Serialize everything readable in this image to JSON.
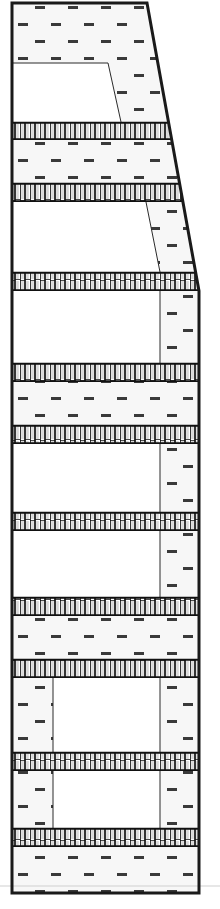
{
  "figure": {
    "kind": "engineering-cross-section",
    "canvas": {
      "width": 220,
      "height": 909,
      "background": "#ffffff"
    },
    "colors": {
      "outline": "#1a1a1a",
      "inner_line": "#2b2b2b",
      "hatch_dash": "#3a3a3a",
      "hatch_background": "#f7f7f7",
      "corrugation_stroke": "#111111",
      "corrugation_fill": "#d9d9d9",
      "plain_fill": "#ffffff",
      "faint_baseline": "#cfcfcf"
    },
    "geometry": {
      "left_edge_x": 12,
      "right_edge_bottom_x": 199,
      "right_edge_top_x": 147,
      "taper_top_y": 0,
      "taper_end_y": 291,
      "top_y": 3,
      "bottom_y": 893,
      "outline_stroke_width": 3,
      "faint_baseline_y": 886
    },
    "hatch_pattern": {
      "name": "dashed-stipple",
      "dash_width": 10,
      "dash_height": 3,
      "dash_spacing_x": 33,
      "dash_spacing_y": 17,
      "stagger": "brick-offset-half"
    },
    "corrugation_pattern": {
      "name": "square-wave-crenellation",
      "period": 10,
      "stroke_width": 1.6,
      "description": "vertical square-wave / crenellated core band"
    }
  },
  "layers": [
    {
      "id": "L01",
      "name": "hatched-band-top",
      "type": "hatched",
      "y_top": 3,
      "y_bottom": 63,
      "label": "Hatched band"
    },
    {
      "id": "L02",
      "name": "plain-band-tapered-upper",
      "type": "plain-tapered",
      "y_top": 63,
      "y_bottom": 122,
      "label": "Plain band (tapered)",
      "inner_line_top_x": 108,
      "inner_line_bottom_x": 121
    },
    {
      "id": "L03",
      "name": "corrugated-core-1",
      "type": "corrugated",
      "y_top": 122,
      "y_bottom": 140,
      "label": "Corrugated core"
    },
    {
      "id": "L04",
      "name": "hatched-band-2",
      "type": "hatched",
      "y_top": 140,
      "y_bottom": 183,
      "label": "Hatched band"
    },
    {
      "id": "L05",
      "name": "corrugated-core-2",
      "type": "corrugated",
      "y_top": 183,
      "y_bottom": 202,
      "label": "Corrugated core"
    },
    {
      "id": "L06",
      "name": "plain-band-tapered-lower",
      "type": "plain-tapered",
      "y_top": 202,
      "y_bottom": 272,
      "label": "Plain band (tapered)",
      "inner_line_top_x": 146,
      "inner_line_bottom_x": 160
    },
    {
      "id": "L07",
      "name": "corrugated-core-3",
      "type": "corrugated",
      "y_top": 272,
      "y_bottom": 291,
      "label": "Corrugated core"
    },
    {
      "id": "L08",
      "name": "plain-band-right-hatch-1",
      "type": "plain-right",
      "y_top": 291,
      "y_bottom": 363,
      "label": "Plain band with right hatch",
      "inner_line_x": 160
    },
    {
      "id": "L09",
      "name": "corrugated-core-4",
      "type": "corrugated",
      "y_top": 363,
      "y_bottom": 382,
      "label": "Corrugated core"
    },
    {
      "id": "L10",
      "name": "hatched-band-3",
      "type": "hatched",
      "y_top": 382,
      "y_bottom": 425,
      "label": "Hatched band"
    },
    {
      "id": "L11",
      "name": "corrugated-core-5",
      "type": "corrugated",
      "y_top": 425,
      "y_bottom": 444,
      "label": "Corrugated core"
    },
    {
      "id": "L12",
      "name": "plain-band-right-hatch-2",
      "type": "plain-right",
      "y_top": 444,
      "y_bottom": 512,
      "label": "Plain band with right hatch",
      "inner_line_x": 160
    },
    {
      "id": "L13",
      "name": "corrugated-core-6",
      "type": "corrugated",
      "y_top": 512,
      "y_bottom": 531,
      "label": "Corrugated core"
    },
    {
      "id": "L14",
      "name": "plain-band-right-hatch-3",
      "type": "plain-right",
      "y_top": 531,
      "y_bottom": 597,
      "label": "Plain band with right hatch",
      "inner_line_x": 160
    },
    {
      "id": "L15",
      "name": "corrugated-core-7",
      "type": "corrugated",
      "y_top": 597,
      "y_bottom": 616,
      "label": "Corrugated core"
    },
    {
      "id": "L16",
      "name": "hatched-band-4",
      "type": "hatched",
      "y_top": 616,
      "y_bottom": 659,
      "label": "Hatched band"
    },
    {
      "id": "L17",
      "name": "corrugated-core-8",
      "type": "corrugated",
      "y_top": 659,
      "y_bottom": 678,
      "label": "Corrugated core"
    },
    {
      "id": "L18",
      "name": "plain-band-both-hatch-1",
      "type": "plain-both",
      "y_top": 678,
      "y_bottom": 752,
      "label": "Plain band with side hatches",
      "inner_line_left_x": 53,
      "inner_line_right_x": 160
    },
    {
      "id": "L19",
      "name": "corrugated-core-9",
      "type": "corrugated",
      "y_top": 752,
      "y_bottom": 771,
      "label": "Corrugated core"
    },
    {
      "id": "L20",
      "name": "plain-band-both-hatch-2",
      "type": "plain-both",
      "y_top": 771,
      "y_bottom": 828,
      "label": "Plain band with side hatches",
      "inner_line_left_x": 53,
      "inner_line_right_x": 160
    },
    {
      "id": "L21",
      "name": "corrugated-core-10",
      "type": "corrugated",
      "y_top": 828,
      "y_bottom": 847,
      "label": "Corrugated core"
    },
    {
      "id": "L22",
      "name": "hatched-band-bottom",
      "type": "hatched",
      "y_top": 847,
      "y_bottom": 893,
      "label": "Hatched band"
    }
  ]
}
